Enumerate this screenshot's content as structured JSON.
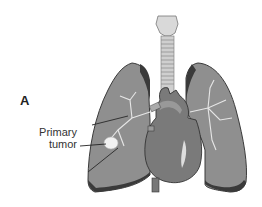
{
  "figure": {
    "panel_letter": "A",
    "annotation": {
      "line1": "Primary",
      "line2": "tumor"
    },
    "colors": {
      "lung_fill": "#8e8e8e",
      "lung_edge": "#3a3a3a",
      "heart_fill": "#7a7a7a",
      "trachea_fill": "#d6d6d6",
      "tumor_fill": "#f2f2f2",
      "background": "#ffffff"
    }
  }
}
